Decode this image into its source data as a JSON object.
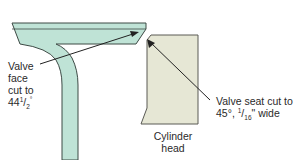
{
  "diagram": {
    "colors": {
      "valve_fill": "#bfe3d6",
      "valve_stroke": "#3d4a45",
      "head_fill": "#e6e7d5",
      "head_stroke": "#5a5a55",
      "arrow": "#222222",
      "text": "#2a2a2a"
    },
    "labels": {
      "valve_face": [
        "Valve",
        "face",
        "cut to",
        "44",
        "1",
        "2",
        "°"
      ],
      "valve_seat_line1": "Valve seat cut to",
      "valve_seat_line2_a": "45°, ",
      "valve_seat_line2_num": "1",
      "valve_seat_line2_den": "16",
      "valve_seat_line2_b": "\" wide",
      "cylinder_head": [
        "Cylinder",
        "head"
      ]
    },
    "components": [
      "valve",
      "cylinder-head",
      "valve-face-arrow",
      "valve-seat-arrow"
    ]
  }
}
